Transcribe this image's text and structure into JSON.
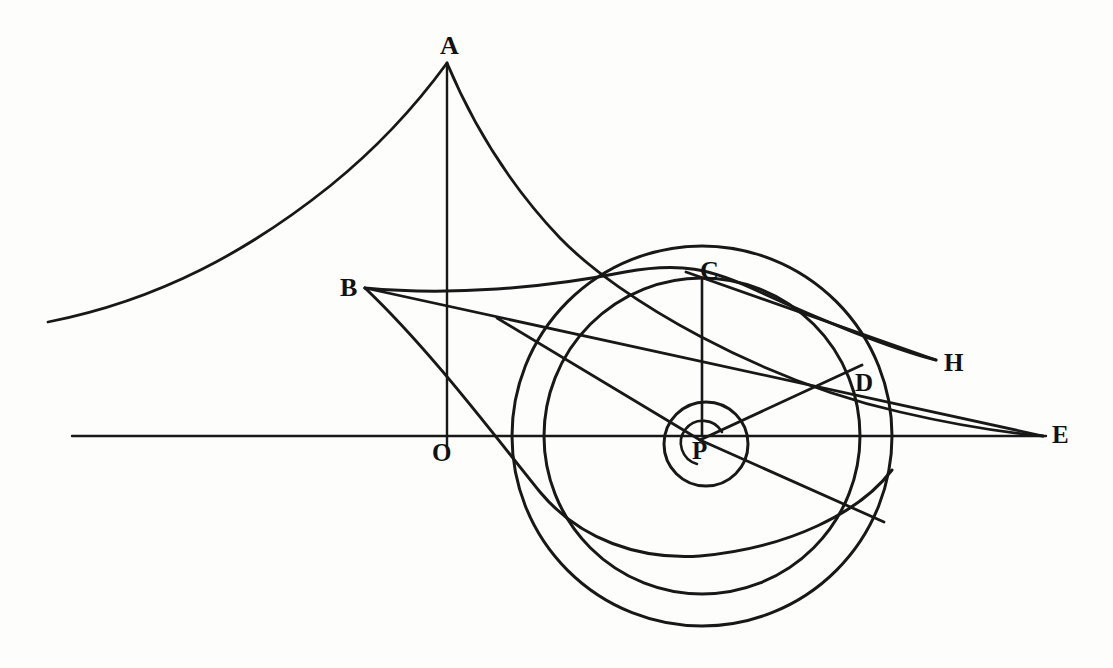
{
  "figure": {
    "background_color": "#fdfdfc",
    "ink_color": "#181818"
  },
  "labels": [
    {
      "id": "A",
      "text": "A",
      "x": 440,
      "y": 33,
      "size": 26
    },
    {
      "id": "B",
      "text": "B",
      "x": 340,
      "y": 275,
      "size": 26
    },
    {
      "id": "C",
      "text": "C",
      "x": 700,
      "y": 258,
      "size": 26
    },
    {
      "id": "D",
      "text": "D",
      "x": 855,
      "y": 370,
      "size": 25
    },
    {
      "id": "E",
      "text": "E",
      "x": 1052,
      "y": 422,
      "size": 25
    },
    {
      "id": "H",
      "text": "H",
      "x": 944,
      "y": 350,
      "size": 25
    },
    {
      "id": "O",
      "text": "O",
      "x": 432,
      "y": 440,
      "size": 25
    },
    {
      "id": "P",
      "text": "P",
      "x": 692,
      "y": 438,
      "size": 25
    }
  ],
  "points": {
    "A": {
      "x": 448,
      "y": 63
    },
    "B": {
      "x": 365,
      "y": 288
    },
    "C": {
      "x": 702,
      "y": 278
    },
    "D": {
      "x": 862,
      "y": 365
    },
    "E": {
      "x": 1043,
      "y": 436
    },
    "H": {
      "x": 936,
      "y": 360
    },
    "O": {
      "x": 447,
      "y": 436
    },
    "P": {
      "x": 702,
      "y": 436
    }
  },
  "axis": {
    "name": "horizontal-axis",
    "x1": 72,
    "y1": 436,
    "x2": 1046,
    "y2": 436,
    "stroke_width": 2.4
  },
  "vertical_line": {
    "name": "vertical-axis-through-A",
    "x1": 447,
    "y1": 63,
    "x2": 447,
    "y2": 446,
    "stroke_width": 2.4
  },
  "circles": [
    {
      "name": "outer-circle",
      "cx": 702,
      "cy": 436,
      "r": 190,
      "stroke_width": 3.0
    },
    {
      "name": "middle-circle",
      "cx": 702,
      "cy": 436,
      "r": 158,
      "stroke_width": 3.0
    },
    {
      "name": "inner-circle",
      "cx": 706,
      "cy": 444,
      "r": 42,
      "stroke_width": 3.0
    },
    {
      "name": "innermost-arc",
      "cx": 700,
      "cy": 442,
      "r": 22,
      "stroke_width": 2.6
    }
  ],
  "straight_lines": [
    {
      "name": "line-B-to-E",
      "x1": 365,
      "y1": 288,
      "x2": 1043,
      "y2": 436
    },
    {
      "name": "line-P-to-C",
      "x1": 702,
      "y1": 436,
      "x2": 702,
      "y2": 278
    },
    {
      "name": "line-P-to-D",
      "x1": 700,
      "y1": 440,
      "x2": 862,
      "y2": 365
    },
    {
      "name": "line-through-P-upper-left",
      "x1": 497,
      "y1": 318,
      "x2": 700,
      "y2": 440
    },
    {
      "name": "line-through-P-lower-right",
      "x1": 700,
      "y1": 440,
      "x2": 884,
      "y2": 522
    },
    {
      "name": "line-C-to-H",
      "x1": 686,
      "y1": 272,
      "x2": 936,
      "y2": 360
    }
  ],
  "curves": [
    {
      "name": "curve-left-tail-to-A",
      "description": "long concave branch rising from lower-left to the cusp at A"
    },
    {
      "name": "curve-A-to-E",
      "description": "branch falling from cusp A through C region down to E"
    },
    {
      "name": "curve-B-to-H",
      "description": "gently arched branch from cusp B rightward past C to H"
    },
    {
      "name": "curve-B-descending",
      "description": "branch from cusp B sweeping down and right, tangent to the outer circle"
    }
  ],
  "colors": {
    "ink": "#181818",
    "paper": "#fdfdfc"
  }
}
